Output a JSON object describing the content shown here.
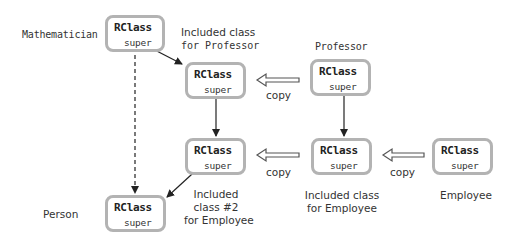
{
  "diagram": {
    "boxes": {
      "mathematician": {
        "class_label": "RClass",
        "field_label": "super",
        "name": "Mathematician"
      },
      "included_professor": {
        "class_label": "RClass",
        "field_label": "super",
        "name_line1": "Included class",
        "name_line2": "for Professor"
      },
      "professor": {
        "class_label": "RClass",
        "field_label": "super",
        "name": "Professor"
      },
      "included_employee_2": {
        "class_label": "RClass",
        "field_label": "super",
        "name_line1": "Included",
        "name_line2": "class #2",
        "name_line3": "for Employee"
      },
      "included_employee": {
        "class_label": "RClass",
        "field_label": "super",
        "name_line1": "Included class",
        "name_line2": "for Employee"
      },
      "employee": {
        "class_label": "RClass",
        "field_label": "super",
        "name": "Employee"
      },
      "person": {
        "class_label": "RClass",
        "field_label": "super",
        "name": "Person"
      }
    },
    "copy_arrows": [
      {
        "label": "copy",
        "from": "professor",
        "to": "included_professor"
      },
      {
        "label": "copy",
        "from": "included_employee",
        "to": "included_employee_2"
      },
      {
        "label": "copy",
        "from": "employee",
        "to": "included_employee"
      }
    ],
    "super_pointers": [
      {
        "from": "mathematician",
        "to": "included_professor",
        "style": "solid"
      },
      {
        "from": "mathematician",
        "to": "person",
        "style": "dashed"
      },
      {
        "from": "included_professor",
        "to": "included_employee_2",
        "style": "solid"
      },
      {
        "from": "included_employee_2",
        "to": "person",
        "style": "solid"
      },
      {
        "from": "professor",
        "to": "included_employee",
        "style": "solid"
      }
    ],
    "colors": {
      "box_border": "#b3b3b3",
      "arrow": "#222222",
      "text": "#333333"
    }
  }
}
